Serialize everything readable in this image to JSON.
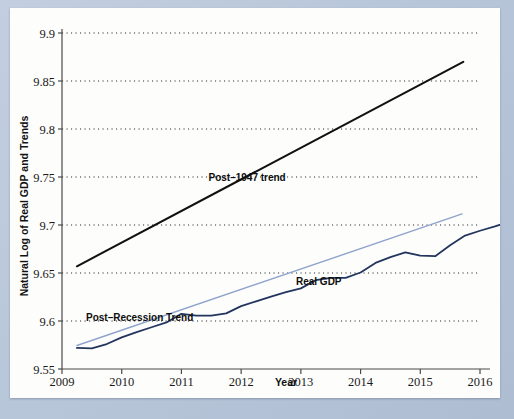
{
  "chart_data": {
    "type": "line",
    "title": "",
    "xlabel": "Year",
    "ylabel": "Natural Log of Real GDP and Trends",
    "xlim": [
      2009,
      2016
    ],
    "ylim": [
      9.55,
      9.9
    ],
    "xticks": [
      "2009",
      "2010",
      "2011",
      "2012",
      "2013",
      "2014",
      "2015",
      "2016"
    ],
    "yticks": [
      "9.55",
      "9.6",
      "9.65",
      "9.7",
      "9.75",
      "9.8",
      "9.85",
      "9.9"
    ],
    "grid": "horizontal-dotted",
    "legend": "inline-annotations",
    "series": [
      {
        "name": "Real GDP",
        "color": "#23355e",
        "style": "solid",
        "width": 1.8,
        "points": [
          [
            2009.25,
            9.572
          ],
          [
            2009.5,
            9.5715
          ],
          [
            2009.75,
            9.576
          ],
          [
            2010.0,
            9.583
          ],
          [
            2010.25,
            9.5885
          ],
          [
            2010.5,
            9.5935
          ],
          [
            2010.75,
            9.5985
          ],
          [
            2011.0,
            9.6075
          ],
          [
            2011.25,
            9.6055
          ],
          [
            2011.5,
            9.6055
          ],
          [
            2011.75,
            9.608
          ],
          [
            2012.0,
            9.6155
          ],
          [
            2012.25,
            9.6205
          ],
          [
            2012.5,
            9.6255
          ],
          [
            2012.75,
            9.63
          ],
          [
            2013.0,
            9.634
          ],
          [
            2013.25,
            9.6425
          ],
          [
            2013.5,
            9.645
          ],
          [
            2013.75,
            9.645
          ],
          [
            2014.0,
            9.6505
          ],
          [
            2014.25,
            9.6605
          ],
          [
            2014.5,
            9.6665
          ],
          [
            2014.75,
            9.6715
          ],
          [
            2015.0,
            9.668
          ],
          [
            2015.25,
            9.6675
          ],
          [
            2015.5,
            9.679
          ],
          [
            2015.75,
            9.689
          ],
          [
            2016.0,
            9.694
          ],
          [
            2016.25,
            9.6985
          ],
          [
            2016.5,
            9.7035
          ],
          [
            2016.75,
            9.707
          ],
          [
            2017.0,
            9.71
          ],
          [
            2017.25,
            9.7105
          ],
          [
            2017.5,
            9.711
          ]
        ]
      },
      {
        "name": "Post-Recession Trend",
        "color": "#8fa4cc",
        "style": "solid",
        "width": 1.4,
        "points": [
          [
            2009.25,
            9.5745
          ],
          [
            2015.7,
            9.7115
          ]
        ]
      },
      {
        "name": "Post-1947 trend",
        "color": "#111111",
        "style": "solid",
        "width": 2.0,
        "points": [
          [
            2009.25,
            9.657
          ],
          [
            2015.72,
            9.87
          ]
        ]
      }
    ],
    "annotations": [
      {
        "text": "Post–1947 trend",
        "x": 2012.1,
        "y": 9.7455
      },
      {
        "text": "Real GDP",
        "x": 2013.3,
        "y": 9.6375
      },
      {
        "text": "Post–Recession Trend",
        "x": 2010.3,
        "y": 9.5995
      }
    ]
  }
}
